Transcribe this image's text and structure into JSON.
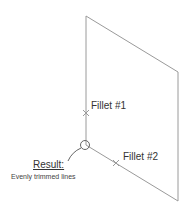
{
  "diagram": {
    "labels": {
      "fillet1": "Fillet #1",
      "fillet2": "Fillet #2",
      "result_title": "Result:",
      "result_desc": "Evenly trimmed lines"
    },
    "colors": {
      "line": "#9a9a9a",
      "text": "#333333",
      "background": "#ffffff"
    }
  }
}
